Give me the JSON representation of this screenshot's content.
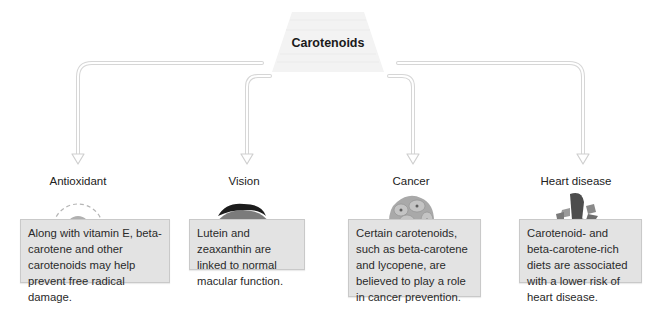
{
  "title": "Carotenoids",
  "colors": {
    "box_fill": "#e3e3e3",
    "box_border": "#c9c9c9",
    "arrow_stroke": "#d4d4d4",
    "title_fill": "#f3f3f3"
  },
  "branches": [
    {
      "label": "Antioxidant",
      "icon": "antioxidant-cell-icon",
      "text": "Along with vitamin E, beta-carotene and other carotenoids may help prevent free radical damage.",
      "lines": [
        "Along with vitamin E,",
        "beta-carotene and other",
        "carotenoids may help prevent",
        "free radical damage."
      ]
    },
    {
      "label": "Vision",
      "icon": "eye-icon",
      "text": "Lutein and zeaxanthin are linked to normal macular function.",
      "lines": [
        "Lutein and zeaxanthin",
        "are linked to normal",
        "macular function."
      ]
    },
    {
      "label": "Cancer",
      "icon": "cancer-cell-cluster-icon",
      "text": "Certain carotenoids, such as beta-carotene and lycopene, are believed to play a role in cancer prevention.",
      "lines": [
        "Certain carotenoids, such",
        "as beta-carotene and",
        "lycopene, are believed to",
        "play a role in cancer",
        "prevention."
      ]
    },
    {
      "label": "Heart disease",
      "icon": "heart-icon",
      "text": "Carotenoid- and beta-carotene-rich diets are associated with a lower risk of heart disease.",
      "lines": [
        "Carotenoid- and beta-",
        "carotene-rich diets are",
        "associated with a lower",
        "risk of heart disease."
      ]
    }
  ]
}
